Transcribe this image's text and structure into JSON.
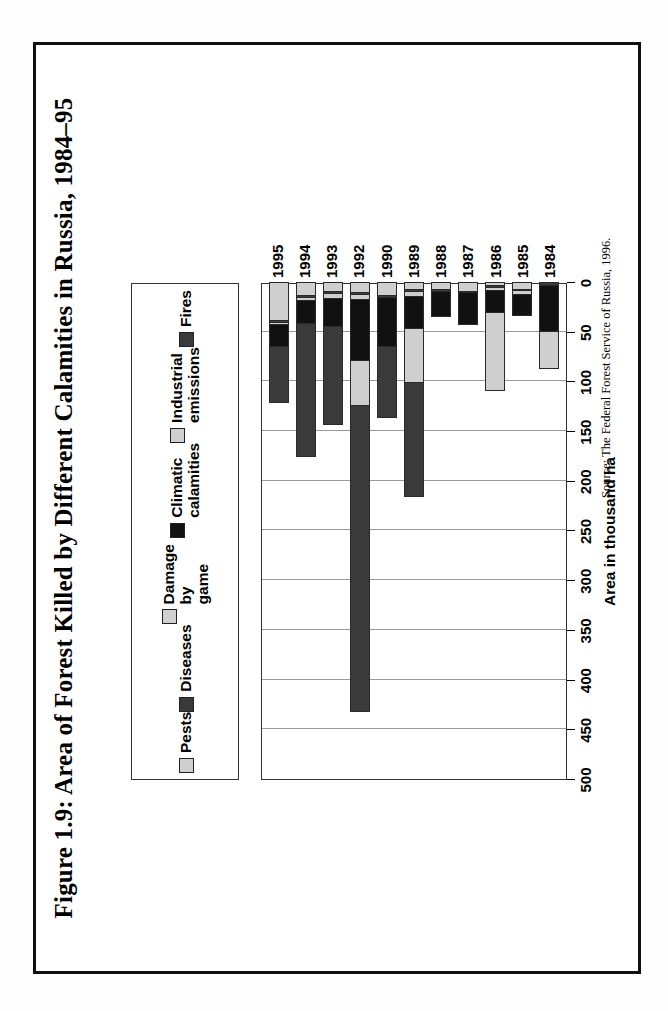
{
  "figure": {
    "title": "Figure 1.9: Area of Forest Killed by Different Calamities in\nRussia, 1984–95",
    "source": "Source: The Federal Forest Service of Russia, 1996."
  },
  "chart_data": {
    "type": "bar",
    "orientation": "horizontal",
    "stacked": true,
    "title": "Figure 1.9: Area of Forest Killed by Different Calamities in Russia, 1984–95",
    "xlabel": "",
    "ylabel": "Area in thousand ha",
    "ylim": [
      0,
      500
    ],
    "ticks": [
      "0",
      "50",
      "100",
      "150",
      "200",
      "250",
      "300",
      "350",
      "400",
      "450",
      "500"
    ],
    "grid": true,
    "legend_position": "top",
    "categories": [
      "1984",
      "1985",
      "1986",
      "1987",
      "1988",
      "1989",
      "1990",
      "1992",
      "1993",
      "1994",
      "1995"
    ],
    "series": [
      {
        "name": "Fires",
        "color": "#3a3a3a",
        "values": [
          0,
          0,
          0,
          0,
          0,
          115,
          73,
          310,
          100,
          135,
          58
        ]
      },
      {
        "name": "Industrial emissions",
        "color": "#cfcfcf",
        "values": [
          39,
          0,
          80,
          0,
          0,
          55,
          0,
          45,
          0,
          0,
          0
        ]
      },
      {
        "name": "Climatic calamities",
        "color": "#111111",
        "values": [
          47,
          22,
          23,
          33,
          27,
          33,
          50,
          62,
          29,
          24,
          22
        ]
      },
      {
        "name": "Damage by game",
        "color": "#cfcfcf",
        "values": [
          0,
          4,
          3,
          0,
          0,
          5,
          0,
          5,
          5,
          3,
          2
        ]
      },
      {
        "name": "Diseases",
        "color": "#3a3a3a",
        "values": [
          2,
          2,
          2,
          2,
          2,
          2,
          2,
          2,
          2,
          2,
          2
        ]
      },
      {
        "name": "Pests",
        "color": "#cfcfcf",
        "values": [
          0,
          6,
          2,
          8,
          6,
          6,
          12,
          9,
          8,
          12,
          38
        ]
      }
    ]
  },
  "legend": {
    "items": [
      {
        "label": "Fires",
        "swatch": "#3a3a3a"
      },
      {
        "label": "Industrial\nemissions",
        "swatch": "#cfcfcf"
      },
      {
        "label": "Climatic\ncalamities",
        "swatch": "#111111"
      },
      {
        "label": "Damage by\ngame",
        "swatch": "#cfcfcf"
      },
      {
        "label": "Diseases",
        "swatch": "#3a3a3a"
      },
      {
        "label": "Pests",
        "swatch": "#cfcfcf"
      }
    ]
  }
}
